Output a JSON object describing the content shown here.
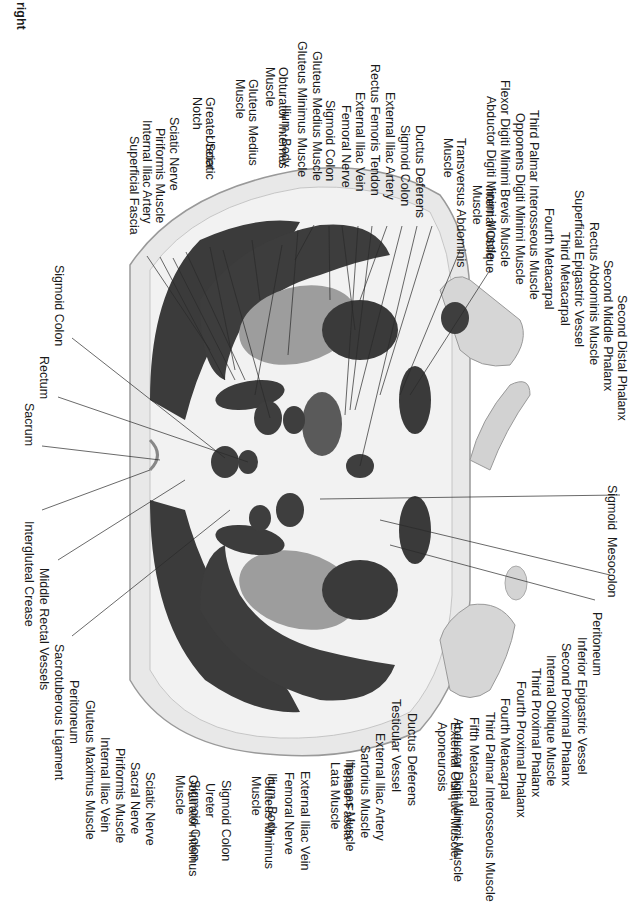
{
  "orientation_label": "right",
  "top_labels": [
    {
      "x": 140,
      "y": 136,
      "text": "Superficial Fascia"
    },
    {
      "x": 153,
      "y": 120,
      "text": "Internal Iliac Artery"
    },
    {
      "x": 166,
      "y": 128,
      "text": "Piriformis Muscle"
    },
    {
      "x": 180,
      "y": 117,
      "text": "Sciatic Nerve"
    },
    {
      "x": 203,
      "y": 97,
      "text": "Greater Sciatic\nNotch"
    },
    {
      "x": 216,
      "y": 135,
      "text": "Ureter"
    },
    {
      "x": 246,
      "y": 79,
      "text": "Gluteus Medius\nMuscle"
    },
    {
      "x": 276,
      "y": 67,
      "text": "Obturator Internus\nMuscle"
    },
    {
      "x": 292,
      "y": 105,
      "text": "Ilium, Body"
    },
    {
      "x": 308,
      "y": 41,
      "text": "Gluteus Minimus Muscle"
    },
    {
      "x": 323,
      "y": 51,
      "text": "Gluteus Medius Muscle"
    },
    {
      "x": 336,
      "y": 100,
      "text": "Sigmoid Colon"
    },
    {
      "x": 352,
      "y": 105,
      "text": "Femoral Nerve"
    },
    {
      "x": 366,
      "y": 92,
      "text": "External Iliac Vein"
    },
    {
      "x": 381,
      "y": 64,
      "text": "Rectus Femoris Tendon"
    },
    {
      "x": 396,
      "y": 92,
      "text": "External Iliac Artery"
    },
    {
      "x": 411,
      "y": 125,
      "text": "Sigmoid Colon"
    },
    {
      "x": 426,
      "y": 125,
      "text": "Ductus Deferens"
    },
    {
      "x": 454,
      "y": 138,
      "text": "Transversus Abdominis\nMuscle"
    },
    {
      "x": 483,
      "y": 185,
      "text": "Internal Oblique\nMuscle"
    },
    {
      "x": 497,
      "y": 96,
      "text": "Abductor Digiti Minimi Muscle"
    },
    {
      "x": 511,
      "y": 80,
      "text": "Flexor Digiti Minimi Brevis Muscle"
    },
    {
      "x": 526,
      "y": 113,
      "text": "Opponens Digiti Minimi Muscle"
    },
    {
      "x": 540,
      "y": 110,
      "text": "Third Palmar Interosseous Muscle"
    },
    {
      "x": 555,
      "y": 208,
      "text": "Fourth Metacarpal"
    },
    {
      "x": 571,
      "y": 232,
      "text": "Third Metacarpal"
    },
    {
      "x": 585,
      "y": 190,
      "text": "Superficial Epigastric Vessel"
    },
    {
      "x": 600,
      "y": 222,
      "text": "Rectus Abdominis Muscle"
    },
    {
      "x": 614,
      "y": 260,
      "text": "Second Middle Phalanx"
    },
    {
      "x": 628,
      "y": 295,
      "text": "Second Distal Phalanx"
    }
  ],
  "left_labels": [
    {
      "x": 65,
      "y": 265,
      "text": "Sigmoid Colon"
    },
    {
      "x": 50,
      "y": 356,
      "text": "Rectum"
    },
    {
      "x": 35,
      "y": 403,
      "text": "Sacrum"
    },
    {
      "x": 35,
      "y": 521,
      "text": "Intergluteal Crease"
    },
    {
      "x": 50,
      "y": 568,
      "text": "Middle Rectal Vessels"
    },
    {
      "x": 65,
      "y": 644,
      "text": "Sacrotuberous Ligament"
    },
    {
      "x": 80,
      "y": 680,
      "text": "Peritoneum"
    },
    {
      "x": 96,
      "y": 700,
      "text": "Gluteus Maximus Muscle"
    }
  ],
  "bottom_labels": [
    {
      "x": 111,
      "y": 737,
      "text": "Internal Iliac Vein"
    },
    {
      "x": 126,
      "y": 748,
      "text": "Piriformis Muscle"
    },
    {
      "x": 141,
      "y": 762,
      "text": "Sacral Nerve"
    },
    {
      "x": 156,
      "y": 772,
      "text": "Sciatic Nerve"
    },
    {
      "x": 186,
      "y": 775,
      "text": "Obturator Internus\nMuscle"
    },
    {
      "x": 201,
      "y": 780,
      "text": "Sigmoid Colon"
    },
    {
      "x": 216,
      "y": 783,
      "text": "Ureter"
    },
    {
      "x": 232,
      "y": 780,
      "text": "Sigmoid Colon"
    },
    {
      "x": 262,
      "y": 776,
      "text": "Gluteus Minimus\nMuscle"
    },
    {
      "x": 278,
      "y": 773,
      "text": "Ilium, Body"
    },
    {
      "x": 295,
      "y": 772,
      "text": "Femoral Nerve"
    },
    {
      "x": 311,
      "y": 771,
      "text": "External Iliac Vein"
    },
    {
      "x": 341,
      "y": 762,
      "text": "Tensor Fascia\nLata Muscle"
    },
    {
      "x": 356,
      "y": 759,
      "text": "Iliopsoas Muscle"
    },
    {
      "x": 371,
      "y": 745,
      "text": "Sartorius Muscle"
    },
    {
      "x": 386,
      "y": 733,
      "text": "External Iliac Artery"
    },
    {
      "x": 402,
      "y": 699,
      "text": "Testicular Vessel"
    },
    {
      "x": 418,
      "y": 713,
      "text": "Ductus Deferens"
    },
    {
      "x": 448,
      "y": 722,
      "text": "External Oblique Muscle,\nAponeurosis"
    },
    {
      "x": 464,
      "y": 718,
      "text": "Abductor Digiti Minimi Muscle"
    },
    {
      "x": 480,
      "y": 717,
      "text": "Fifth Metacarpal"
    },
    {
      "x": 496,
      "y": 712,
      "text": "Third Palmar Interosseous Muscle"
    },
    {
      "x": 511,
      "y": 698,
      "text": "Fourth Metacarpal"
    },
    {
      "x": 527,
      "y": 681,
      "text": "Fourth Proximal Phalanx"
    },
    {
      "x": 542,
      "y": 668,
      "text": "Third Proximal Phalanx"
    },
    {
      "x": 557,
      "y": 655,
      "text": "Internal Oblique Muscle"
    },
    {
      "x": 572,
      "y": 643,
      "text": "Second Proximal Phalanx"
    },
    {
      "x": 588,
      "y": 637,
      "text": "Inferior Epigastric Vessel"
    },
    {
      "x": 603,
      "y": 612,
      "text": "Peritoneum"
    },
    {
      "x": 618,
      "y": 485,
      "text": "Sigmoid  Mesocolon"
    }
  ],
  "colors": {
    "muscle": "#3a3a3a",
    "fat": "#ececec",
    "skin": "#c9c9c9",
    "fascia": "#f4f4f4",
    "bone": "#9a9a9a",
    "organ": "#4a4a4a",
    "bladder": "#585858",
    "line": "#2a2a2a"
  }
}
